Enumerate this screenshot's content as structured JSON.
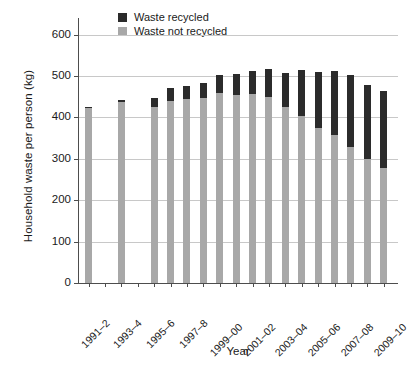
{
  "chart_data": {
    "type": "bar",
    "subtype": "stacked-vertical",
    "title": "",
    "xlabel": "Year",
    "ylabel": "Household waste per person (kg)",
    "ylim": [
      0,
      640
    ],
    "yticks": [
      0,
      100,
      200,
      300,
      400,
      500,
      600
    ],
    "ytick_labels": [
      "0",
      "100",
      "200",
      "300",
      "400",
      "500",
      "600"
    ],
    "grid": "horizontal",
    "legend_position": "top-center",
    "colors": {
      "recycled": "#2b2b2b",
      "not_recycled": "#a8a8a8",
      "gridline": "#c8c8c8",
      "axis": "#4d4d4d",
      "background": "#ffffff"
    },
    "legend": [
      {
        "label": "Waste recycled",
        "color": "#2b2b2b"
      },
      {
        "label": "Waste not recycled",
        "color": "#a8a8a8"
      }
    ],
    "categories": [
      "1991–2",
      "1992–3",
      "1993–4",
      "1994–5",
      "1995–6",
      "1996–7",
      "1997–8",
      "1998–9",
      "1999–00",
      "2000–01",
      "2001–02",
      "2002–03",
      "2003–04",
      "2004–05",
      "2005–06",
      "2006–07",
      "2007–08",
      "2008–09",
      "2009–10"
    ],
    "tick_labels_shown": [
      "1991–2",
      "1993–4",
      "1995–6",
      "1997–8",
      "1999–00",
      "2001–02",
      "2003–04",
      "2005–06",
      "2007–08",
      "2009–10"
    ],
    "series": [
      {
        "name": "Waste not recycled",
        "color": "#a8a8a8",
        "values": [
          423,
          null,
          438,
          null,
          425,
          440,
          444,
          447,
          459,
          454,
          457,
          449,
          425,
          403,
          375,
          357,
          329,
          300,
          277
        ]
      },
      {
        "name": "Waste recycled",
        "color": "#2b2b2b",
        "values": [
          3,
          null,
          4,
          null,
          23,
          30,
          31,
          35,
          43,
          50,
          55,
          67,
          83,
          111,
          134,
          155,
          173,
          179,
          187
        ]
      }
    ],
    "totals": [
      426,
      null,
      442,
      null,
      448,
      470,
      475,
      482,
      502,
      504,
      512,
      516,
      508,
      514,
      509,
      512,
      502,
      479,
      464
    ]
  }
}
